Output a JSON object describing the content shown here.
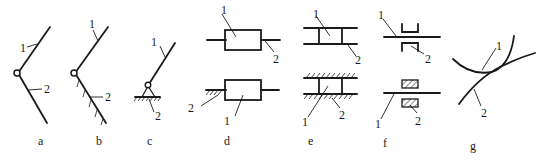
{
  "figure": {
    "panels": [
      {
        "id": "a",
        "caption": "a",
        "labels": [
          "1",
          "2"
        ]
      },
      {
        "id": "b",
        "caption": "b",
        "labels": [
          "1",
          "2"
        ]
      },
      {
        "id": "c",
        "caption": "c",
        "labels": [
          "1",
          "2"
        ]
      },
      {
        "id": "d",
        "caption": "d",
        "labels": [
          "1",
          "2",
          "2",
          "1"
        ]
      },
      {
        "id": "e",
        "caption": "e",
        "labels": [
          "1",
          "2",
          "1",
          "2"
        ]
      },
      {
        "id": "f",
        "caption": "f",
        "labels": [
          "1",
          "2",
          "1",
          "2"
        ]
      },
      {
        "id": "g",
        "caption": "g",
        "labels": [
          "1",
          "2"
        ]
      }
    ]
  }
}
